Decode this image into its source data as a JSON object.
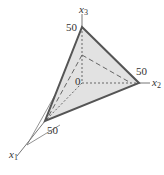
{
  "diagram": {
    "type": "3d-simplex-plane",
    "axes": {
      "x1": {
        "label": "x",
        "subscript": "1",
        "tick": "50"
      },
      "x2": {
        "label": "x",
        "subscript": "2",
        "tick": "50"
      },
      "x3": {
        "label": "x",
        "subscript": "3",
        "tick": "50"
      }
    },
    "origin_label": "0",
    "colors": {
      "face_fill": "#e2e2e2",
      "edge": "#555555",
      "axis": "#777777",
      "dashed": "#666666"
    }
  }
}
